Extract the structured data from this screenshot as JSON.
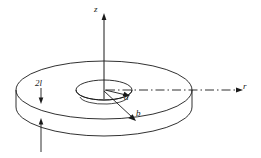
{
  "figure": {
    "type": "technical-line-diagram",
    "background_color": "#ffffff",
    "stroke_color": "#1a1a1a",
    "labels": {
      "z_axis": "z",
      "r_axis": "r",
      "inner_radius": "a",
      "outer_radius": "b",
      "thickness": "2l"
    },
    "axes": [
      {
        "name": "z-axis",
        "label": "z",
        "direction": "vertical-up",
        "line_style": "solid"
      },
      {
        "name": "r-axis",
        "label": "r",
        "direction": "horizontal-right",
        "line_style": "dash-dot"
      }
    ],
    "dimensions": [
      {
        "name": "inner-radius",
        "label": "a",
        "arrow": "center-to-inner-edge"
      },
      {
        "name": "outer-radius",
        "label": "b",
        "arrow": "center-to-outer-edge"
      },
      {
        "name": "thickness",
        "label": "2l",
        "arrow": "double-headed-vertical"
      }
    ],
    "geometry": {
      "center_x": 104,
      "center_y": 90,
      "outer_rx": 88,
      "outer_ry": 29,
      "inner_rx": 28,
      "inner_ry": 10,
      "disk_thickness_px": 17
    }
  }
}
